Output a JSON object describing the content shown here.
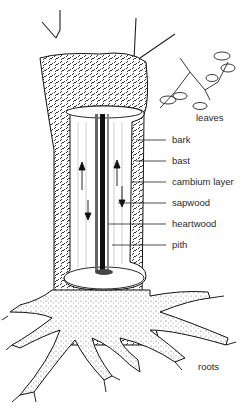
{
  "diagram": {
    "labels": {
      "leaves": "leaves",
      "bark": "bark",
      "bast": "bast",
      "cambium": "cambium layer",
      "sapwood": "sapwood",
      "heartwood": "heartwood",
      "pith": "pith",
      "roots": "roots"
    },
    "colors": {
      "ink": "#1a1a1a",
      "background": "#ffffff",
      "label": "#2a2a2a"
    }
  }
}
